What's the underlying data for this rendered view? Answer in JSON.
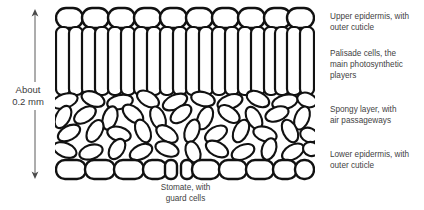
{
  "figure": {
    "type": "diagram"
  },
  "scale": {
    "icon": "double-headed-vertical-arrow",
    "line1": "About",
    "line2": "0.2 mm"
  },
  "labels": {
    "upper_epidermis": {
      "line1": "Upper epidermis, with",
      "line2": "outer cuticle"
    },
    "palisade": {
      "line1": "Palisade cells, the",
      "line2": "main photosynthetic",
      "line3": "players"
    },
    "spongy": {
      "line1": "Spongy layer, with",
      "line2": "air passageways"
    },
    "lower_epidermis": {
      "line1": "Lower epidermis, with",
      "line2": "outer cuticle"
    }
  },
  "stomate_caption": {
    "line1": "Stomate, with",
    "line2": "guard cells"
  },
  "colors": {
    "stroke": "#111111",
    "fill": "#ffffff",
    "text": "#3f3f3f",
    "scale_arrow": "#5a5a5a",
    "background": "#ffffff"
  },
  "layers": [
    {
      "name": "upper-epidermis",
      "cells": 10,
      "shape": "rounded-oval-row"
    },
    {
      "name": "palisade",
      "cells": 20,
      "shape": "tall-column"
    },
    {
      "name": "spongy",
      "cells": 44,
      "shape": "scattered-ovals"
    },
    {
      "name": "lower-epidermis",
      "cells": 9,
      "shape": "rounded-oval-row"
    }
  ]
}
